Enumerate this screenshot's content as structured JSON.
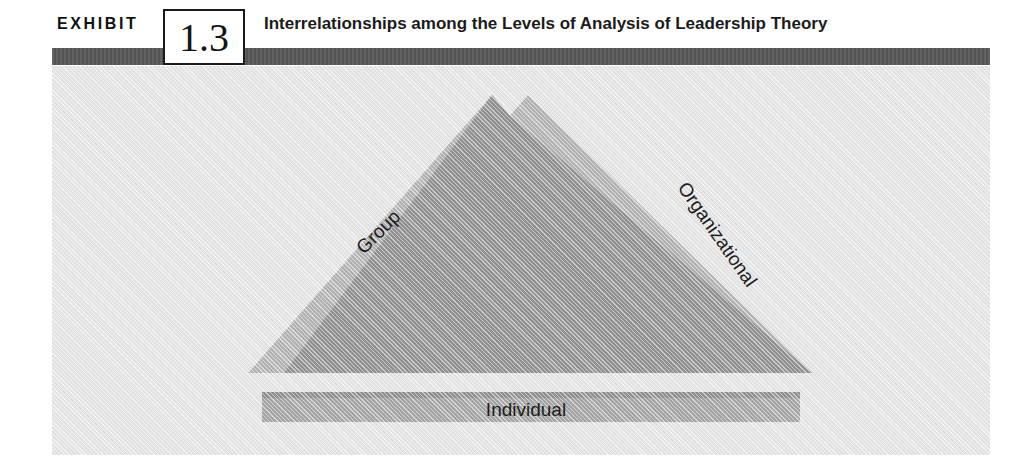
{
  "exhibit": {
    "label": "EXHIBIT",
    "number": "1.3",
    "title": "Interrelationships among the Levels of Analysis of Leadership Theory"
  },
  "diagram": {
    "type": "overlapping-triangles",
    "levels": [
      {
        "name": "Group",
        "position": "left-edge",
        "rotation_deg": -45
      },
      {
        "name": "Organizational",
        "position": "right-edge",
        "rotation_deg": 55
      },
      {
        "name": "Individual",
        "position": "base-band",
        "rotation_deg": 0
      }
    ]
  },
  "colors": {
    "header_rule": "#575757",
    "panel_background": "#e8e8e8",
    "triangle_light": "#b4b4b4",
    "triangle_overlap": "#8e8e8e",
    "base_band": "#a8a8a8",
    "base_band_top": "#8e8e8e",
    "box_border": "#1a1a1a",
    "text": "#1b1b1b"
  }
}
